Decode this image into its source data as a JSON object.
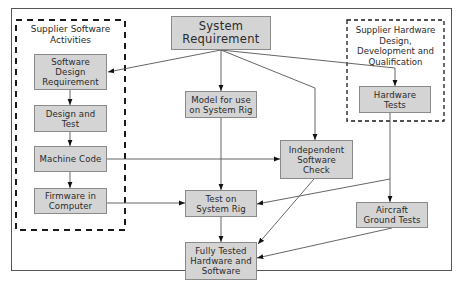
{
  "diagram": {
    "cropped_title": "...ng sys...",
    "groups": [
      {
        "id": "software",
        "label": "Supplier Software\nActivities"
      },
      {
        "id": "hardware",
        "label": "Supplier Hardware\nDesign,\nDevelopment and\nQualification"
      }
    ],
    "nodes": {
      "system_requirement": "System\nRequirement",
      "software_design_requirement": "Software Design\nRequirement",
      "design_and_test": "Design and\nTest",
      "machine_code": "Machine Code",
      "firmware_in_computer": "Firmware in\nComputer",
      "model_for_system_rig": "Model for use\non System Rig",
      "independent_software_check": "Independent\nSoftware\nCheck",
      "test_on_system_rig": "Test on\nSystem Rig",
      "fully_tested": "Fully Tested\nHardware and\nSoftware",
      "hardware_tests": "Hardware\nTests",
      "aircraft_ground_tests": "Aircraft\nGround Tests"
    },
    "edges": [
      {
        "from": "System Requirement",
        "to": "Software Design Requirement"
      },
      {
        "from": "System Requirement",
        "to": "Model for use on System Rig"
      },
      {
        "from": "System Requirement",
        "to": "Independent Software Check"
      },
      {
        "from": "System Requirement",
        "to": "Hardware Tests"
      },
      {
        "from": "Software Design Requirement",
        "to": "Design and Test"
      },
      {
        "from": "Design and Test",
        "to": "Machine Code"
      },
      {
        "from": "Machine Code",
        "to": "Firmware in Computer"
      },
      {
        "from": "Machine Code",
        "to": "Independent Software Check"
      },
      {
        "from": "Model for use on System Rig",
        "to": "Test on System Rig"
      },
      {
        "from": "Firmware in Computer",
        "to": "Test on System Rig"
      },
      {
        "from": "Hardware Tests",
        "to": "Aircraft Ground Tests"
      },
      {
        "from": "Hardware Tests",
        "to": "Test on System Rig"
      },
      {
        "from": "Independent Software Check",
        "to": "Fully Tested Hardware and Software"
      },
      {
        "from": "Test on System Rig",
        "to": "Fully Tested Hardware and Software"
      },
      {
        "from": "Aircraft Ground Tests",
        "to": "Fully Tested Hardware and Software"
      }
    ],
    "colors": {
      "node_fill": "#d4d4d4",
      "node_border": "#8a8a8a",
      "line": "#555555",
      "arrow": "#111111",
      "dashed_border": "#1a1a1a"
    }
  }
}
